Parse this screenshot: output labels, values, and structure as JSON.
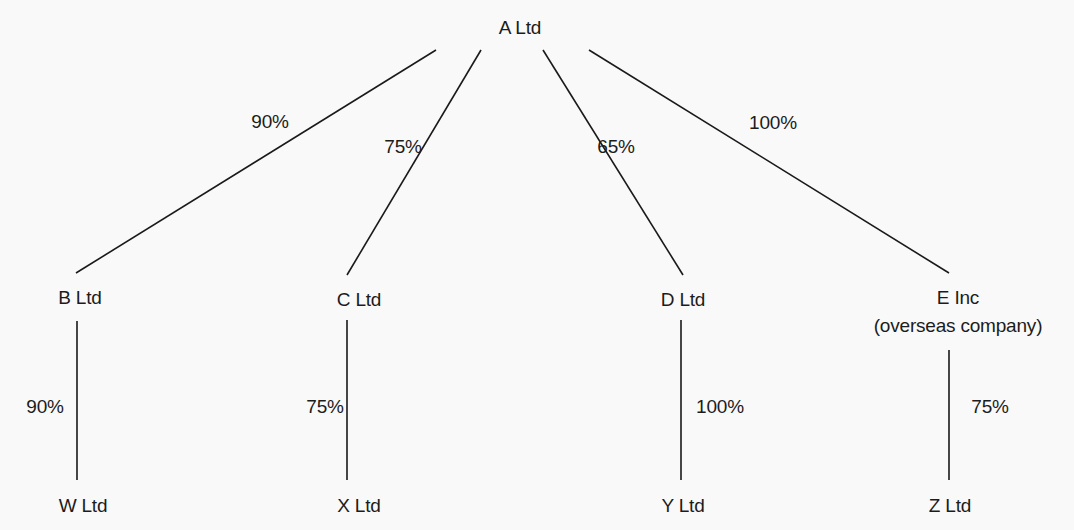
{
  "diagram": {
    "type": "group-structure",
    "colors": {
      "background": "#f9f9f9",
      "line": "#1a1a1a",
      "text": "#1c1c1c"
    },
    "parent": {
      "id": "A",
      "label": "A Ltd"
    },
    "subsidiaries": [
      {
        "id": "B",
        "label": "B Ltd",
        "holding_from_parent": "90%",
        "child": {
          "id": "W",
          "label": "W Ltd",
          "holding": "90%"
        }
      },
      {
        "id": "C",
        "label": "C Ltd",
        "holding_from_parent": "75%",
        "child": {
          "id": "X",
          "label": "X Ltd",
          "holding": "75%"
        }
      },
      {
        "id": "D",
        "label": "D Ltd",
        "holding_from_parent": "65%",
        "child": {
          "id": "Y",
          "label": "Y Ltd",
          "holding": "100%"
        }
      },
      {
        "id": "E",
        "label": "E Inc",
        "sublabel": "(overseas company)",
        "holding_from_parent": "100%",
        "child": {
          "id": "Z",
          "label": "Z Ltd",
          "holding": "75%"
        }
      }
    ],
    "edges": [
      {
        "from": "A",
        "to": "B",
        "label": "90%"
      },
      {
        "from": "A",
        "to": "C",
        "label": "75%"
      },
      {
        "from": "A",
        "to": "D",
        "label": "65%"
      },
      {
        "from": "A",
        "to": "E",
        "label": "100%"
      },
      {
        "from": "B",
        "to": "W",
        "label": "90%"
      },
      {
        "from": "C",
        "to": "X",
        "label": "75%"
      },
      {
        "from": "D",
        "to": "Y",
        "label": "100%"
      },
      {
        "from": "E",
        "to": "Z",
        "label": "75%"
      }
    ]
  }
}
